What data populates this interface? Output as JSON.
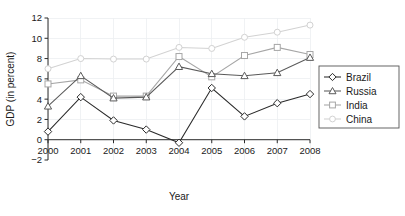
{
  "chart_data": {
    "type": "line",
    "title": "",
    "xlabel": "Year",
    "ylabel": "GDP (in percent)",
    "categories": [
      "2000",
      "2001",
      "2002",
      "2003",
      "2004",
      "2005",
      "2006",
      "2007",
      "2008"
    ],
    "x": [
      2000,
      2001,
      2002,
      2003,
      2004,
      2005,
      2006,
      2007,
      2008
    ],
    "xlim": [
      2000,
      2008
    ],
    "ylim": [
      -2,
      12
    ],
    "yticks": [
      -2,
      0,
      2,
      4,
      6,
      8,
      10,
      12
    ],
    "ytick_labels": [
      "−2",
      "0",
      "2",
      "4",
      "6",
      "8",
      "10",
      "12"
    ],
    "xticks": [
      2000,
      2001,
      2002,
      2003,
      2004,
      2005,
      2006,
      2007,
      2008
    ],
    "grid": true,
    "legend_position": "right-outside",
    "series": [
      {
        "name": "Brazil",
        "marker": "diamond",
        "color": "#2b2b2b",
        "values": [
          0.8,
          4.2,
          1.9,
          1.0,
          -0.3,
          5.1,
          2.3,
          3.6,
          4.5
        ]
      },
      {
        "name": "Russia",
        "marker": "triangle",
        "color": "#5a5a5a",
        "values": [
          3.3,
          6.3,
          4.1,
          4.2,
          7.2,
          6.5,
          6.3,
          6.6,
          8.1
        ]
      },
      {
        "name": "India",
        "marker": "square",
        "color": "#a6a6a6",
        "values": [
          5.5,
          5.9,
          4.3,
          4.3,
          8.2,
          6.2,
          8.3,
          9.1,
          8.4
        ]
      },
      {
        "name": "China",
        "marker": "circle",
        "color": "#d2d2d2",
        "values": [
          7.0,
          8.0,
          7.95,
          7.95,
          9.1,
          9.0,
          10.1,
          10.6,
          11.3
        ]
      }
    ]
  },
  "legend": {
    "entries": [
      {
        "label": "Brazil"
      },
      {
        "label": "Russia"
      },
      {
        "label": "India"
      },
      {
        "label": "China"
      }
    ]
  }
}
